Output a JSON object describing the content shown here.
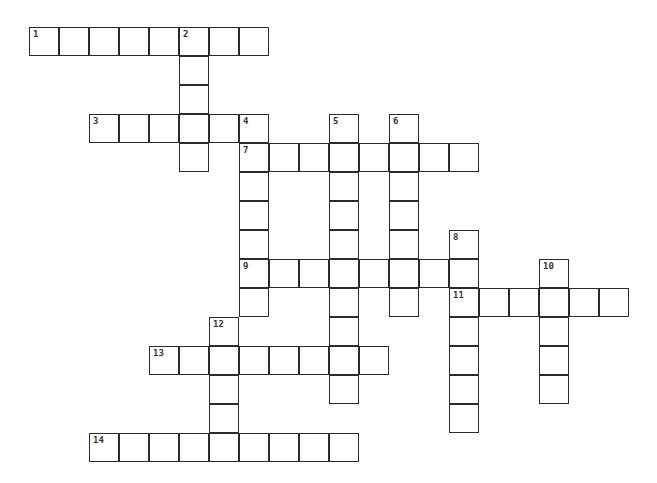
{
  "puzzle": {
    "type": "crossword",
    "cell_width": 30,
    "cell_height": 29,
    "origin_x": 30,
    "origin_y": 28,
    "entries": [
      {
        "number": "1",
        "direction": "across",
        "row": 0,
        "col": 0,
        "length": 8
      },
      {
        "number": "2",
        "direction": "down",
        "row": 0,
        "col": 5,
        "length": 5
      },
      {
        "number": "3",
        "direction": "across",
        "row": 3,
        "col": 2,
        "length": 6
      },
      {
        "number": "4",
        "direction": "down",
        "row": 3,
        "col": 7,
        "length": 7
      },
      {
        "number": "5",
        "direction": "down",
        "row": 3,
        "col": 10,
        "length": 10
      },
      {
        "number": "6",
        "direction": "down",
        "row": 3,
        "col": 12,
        "length": 7
      },
      {
        "number": "7",
        "direction": "across",
        "row": 4,
        "col": 7,
        "length": 8
      },
      {
        "number": "8",
        "direction": "down",
        "row": 7,
        "col": 14,
        "length": 7
      },
      {
        "number": "9",
        "direction": "across",
        "row": 8,
        "col": 7,
        "length": 8
      },
      {
        "number": "10",
        "direction": "down",
        "row": 8,
        "col": 17,
        "length": 5
      },
      {
        "number": "11",
        "direction": "across",
        "row": 9,
        "col": 14,
        "length": 6
      },
      {
        "number": "12",
        "direction": "down",
        "row": 10,
        "col": 6,
        "length": 5
      },
      {
        "number": "13",
        "direction": "across",
        "row": 11,
        "col": 4,
        "length": 8
      },
      {
        "number": "14",
        "direction": "across",
        "row": 14,
        "col": 2,
        "length": 9
      }
    ]
  }
}
